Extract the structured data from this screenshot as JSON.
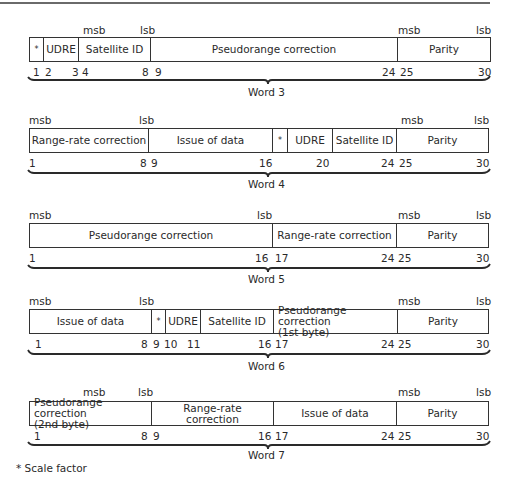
{
  "figure": {
    "footnote": "* Scale factor"
  },
  "words": [
    {
      "caption": "Word 3",
      "fields": [
        {
          "label": "*",
          "from": 1,
          "to": 1
        },
        {
          "label": "UDRE",
          "from": 2,
          "to": 3
        },
        {
          "label": "Satellite ID",
          "from": 4,
          "to": 8
        },
        {
          "label": "Pseudorange correction",
          "from": 9,
          "to": 24
        },
        {
          "label": "Parity",
          "from": 25,
          "to": 30
        }
      ],
      "markers": [
        {
          "text": "msb"
        },
        {
          "text": "lsb"
        },
        {
          "text": "msb"
        },
        {
          "text": "lsb"
        }
      ],
      "bit_numbers": [
        "1",
        "2",
        "3",
        "4",
        "8",
        "9",
        "24",
        "25",
        "30"
      ]
    },
    {
      "caption": "Word 4",
      "fields": [
        {
          "label": "Range-rate correction",
          "from": 1,
          "to": 8
        },
        {
          "label": "Issue of data",
          "from": 9,
          "to": 16
        },
        {
          "label": "*",
          "from": 17,
          "to": 17
        },
        {
          "label": "UDRE",
          "from": 18,
          "to": 20
        },
        {
          "label": "Satellite ID",
          "from": 21,
          "to": 24
        },
        {
          "label": "Parity",
          "from": 25,
          "to": 30
        }
      ],
      "markers": [
        {
          "text": "msb"
        },
        {
          "text": "lsb"
        },
        {
          "text": "msb"
        },
        {
          "text": "lsb"
        }
      ],
      "bit_numbers": [
        "1",
        "8",
        "9",
        "16",
        "20",
        "24",
        "25",
        "30"
      ]
    },
    {
      "caption": "Word 5",
      "fields": [
        {
          "label": "Pseudorange correction",
          "from": 1,
          "to": 16
        },
        {
          "label": "Range-rate correction",
          "from": 17,
          "to": 24
        },
        {
          "label": "Parity",
          "from": 25,
          "to": 30
        }
      ],
      "markers": [
        {
          "text": "msb"
        },
        {
          "text": "lsb"
        },
        {
          "text": "msb"
        },
        {
          "text": "lsb"
        }
      ],
      "bit_numbers": [
        "1",
        "16",
        "17",
        "24",
        "25",
        "30"
      ]
    },
    {
      "caption": "Word 6",
      "fields": [
        {
          "label": "Issue of data",
          "from": 1,
          "to": 8
        },
        {
          "label": "*",
          "from": 9,
          "to": 9
        },
        {
          "label": "UDRE",
          "from": 10,
          "to": 11
        },
        {
          "label": "Satellite ID",
          "from": 12,
          "to": 16
        },
        {
          "label": "Pseudorange correction\n(1st byte)",
          "from": 17,
          "to": 24
        },
        {
          "label": "Parity",
          "from": 25,
          "to": 30
        }
      ],
      "markers": [
        {
          "text": "msb"
        },
        {
          "text": "lsb"
        },
        {
          "text": "msb"
        },
        {
          "text": "lsb"
        }
      ],
      "bit_numbers": [
        "1",
        "8",
        "9",
        "10",
        "11",
        "16",
        "17",
        "24",
        "25",
        "30"
      ]
    },
    {
      "caption": "Word 7",
      "fields": [
        {
          "label": "Pseudorange correction\n(2nd byte)",
          "from": 1,
          "to": 8
        },
        {
          "label": "Range-rate\ncorrection",
          "from": 9,
          "to": 16
        },
        {
          "label": "Issue of data",
          "from": 17,
          "to": 24
        },
        {
          "label": "Parity",
          "from": 25,
          "to": 30
        }
      ],
      "markers": [
        {
          "text": "msb"
        },
        {
          "text": "lsb"
        },
        {
          "text": "msb"
        },
        {
          "text": "lsb"
        }
      ],
      "bit_numbers": [
        "1",
        "8",
        "9",
        "16",
        "17",
        "24",
        "25",
        "30"
      ]
    }
  ]
}
